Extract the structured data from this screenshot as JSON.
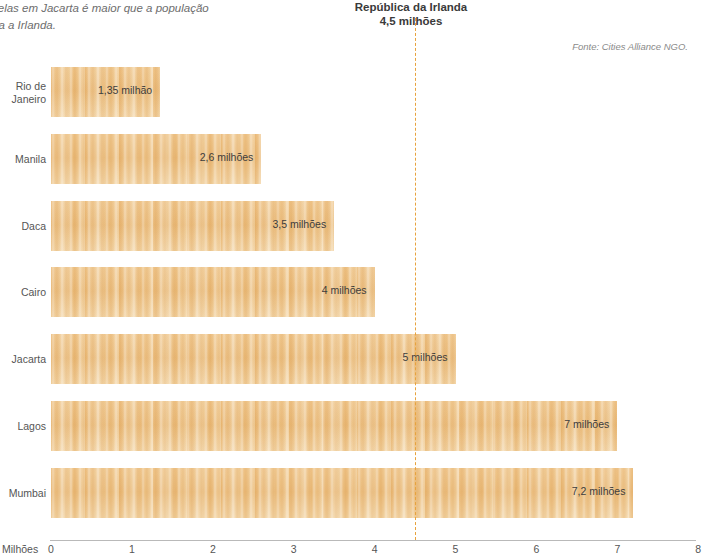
{
  "intro_caption": "velas em Jacarta é maior que a população\nda a Irlanda.",
  "reference": {
    "title": "República da Irlanda",
    "value_label": "4,5 milhões",
    "value": 4.5,
    "line_color": "#e8a33d"
  },
  "source_note": "Fonte: Cities Alliance NGO.",
  "axis": {
    "unit_label": "Milhões",
    "ticks": [
      "0",
      "1",
      "2",
      "3",
      "4",
      "5",
      "6",
      "7",
      "8"
    ]
  },
  "colors": {
    "bar_fill": "#eec186",
    "bar_fill_light": "#f2d3a1",
    "bar_fill_dark": "#e9bb79",
    "text": "#4a4a4a",
    "axis": "#b9b9b9"
  },
  "chart_data": {
    "type": "bar",
    "orientation": "horizontal",
    "title": "República da Irlanda 4,5 milhões",
    "xlabel": "Milhões",
    "ylabel": "",
    "xlim": [
      0,
      8
    ],
    "grid": false,
    "legend": null,
    "categories": [
      "Rio de Janeiro",
      "Manila",
      "Daca",
      "Cairo",
      "Jacarta",
      "Lagos",
      "Mumbai"
    ],
    "values": [
      1.35,
      2.6,
      3.5,
      4,
      5,
      7,
      7.2
    ],
    "value_labels": [
      "1,35 milhão",
      "2,6 milhões",
      "3,5 milhões",
      "4 milhões",
      "5 milhões",
      "7 milhões",
      "7,2 milhões"
    ],
    "annotations": [
      {
        "type": "vline",
        "x": 4.5,
        "label": "República da Irlanda 4,5 milhões",
        "style": "dashed"
      }
    ],
    "source": "Fonte: Cities Alliance NGO.",
    "bars": [
      {
        "category": "Rio de Janeiro",
        "label_lines": [
          "Rio de",
          "Janeiro"
        ],
        "value": 1.35,
        "value_label": "1,35 milhão"
      },
      {
        "category": "Manila",
        "label_lines": [
          "Manila"
        ],
        "value": 2.6,
        "value_label": "2,6 milhões"
      },
      {
        "category": "Daca",
        "label_lines": [
          "Daca"
        ],
        "value": 3.5,
        "value_label": "3,5 milhões"
      },
      {
        "category": "Cairo",
        "label_lines": [
          "Cairo"
        ],
        "value": 4,
        "value_label": "4 milhões"
      },
      {
        "category": "Jacarta",
        "label_lines": [
          "Jacarta"
        ],
        "value": 5,
        "value_label": "5 milhões"
      },
      {
        "category": "Lagos",
        "label_lines": [
          "Lagos"
        ],
        "value": 7,
        "value_label": "7 milhões"
      },
      {
        "category": "Mumbai",
        "label_lines": [
          "Mumbai"
        ],
        "value": 7.2,
        "value_label": "7,2 milhões"
      }
    ]
  }
}
